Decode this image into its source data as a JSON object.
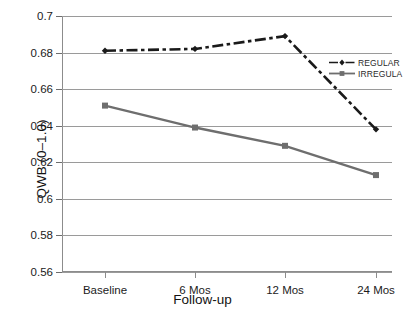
{
  "chart_data": {
    "type": "line",
    "title": "",
    "xlabel": "Follow-up",
    "ylabel": "QWB (0–1.0)",
    "categories": [
      "Baseline",
      "6 Mos",
      "12 Mos",
      "24 Mos"
    ],
    "ylim": [
      0.56,
      0.7
    ],
    "yticks": [
      "0.7",
      "0.68",
      "0.66",
      "0.64",
      "0.62",
      "0.6",
      "0.58",
      "0.56"
    ],
    "ytick_values": [
      0.7,
      0.68,
      0.66,
      0.64,
      0.62,
      0.6,
      0.58,
      0.56
    ],
    "grid": true,
    "legend_position": "right",
    "series": [
      {
        "name": "REGULAR",
        "values": [
          0.681,
          0.682,
          0.689,
          0.638
        ],
        "color": "#1a1a1a",
        "style": "dash-dot",
        "marker": "diamond"
      },
      {
        "name": "IRREGULA",
        "values": [
          0.651,
          0.639,
          0.629,
          0.613
        ],
        "color": "#6e6e6e",
        "style": "solid",
        "marker": "square"
      }
    ]
  },
  "legend": {
    "items": [
      {
        "label": "REGULAR"
      },
      {
        "label": "IRREGULA"
      }
    ]
  },
  "axes": {
    "y_title": "QWB (0–1.0)",
    "x_title": "Follow-up",
    "y_labels": [
      "0.7",
      "0.68",
      "0.66",
      "0.64",
      "0.62",
      "0.6",
      "0.58",
      "0.56"
    ],
    "x_labels": [
      "Baseline",
      "6 Mos",
      "12 Mos",
      "24 Mos"
    ]
  },
  "colors": {
    "regular": "#1a1a1a",
    "irregular": "#6e6e6e",
    "grid": "#9a9a9a",
    "axis": "#8c8c8c",
    "text": "#1b1b1b"
  }
}
